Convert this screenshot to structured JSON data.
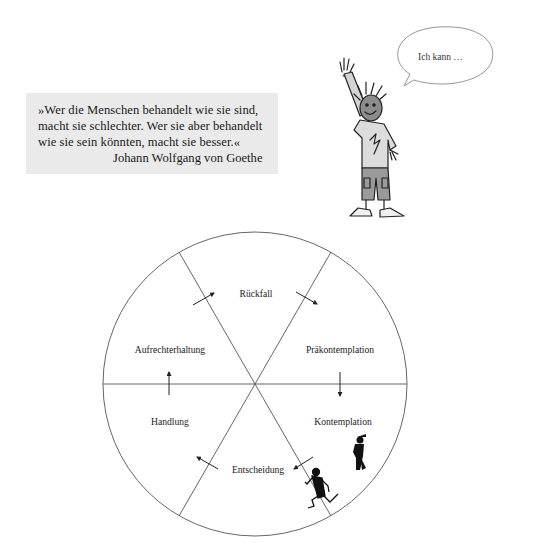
{
  "quote": {
    "lines": [
      "»Wer die Menschen behandelt wie sie sind,",
      "macht sie schlechter. Wer sie aber behandelt",
      "wie sie sein könnten, macht sie besser.«"
    ],
    "author": "Johann Wolfgang von Goethe",
    "background": "#eaeaea"
  },
  "speech_bubble": {
    "text": "Ich kann …"
  },
  "illustration": {
    "figure": "waving-boy-cartoon"
  },
  "cycle": {
    "title": "",
    "center": [
      255,
      384
    ],
    "radius": 152,
    "stages": [
      {
        "label": "Rückfall",
        "x": 256,
        "y": 293
      },
      {
        "label": "Präkontemplation",
        "x": 340,
        "y": 349
      },
      {
        "label": "Kontemplation",
        "x": 343,
        "y": 421
      },
      {
        "label": "Entscheidung",
        "x": 255,
        "y": 469
      },
      {
        "label": "Handlung",
        "x": 170,
        "y": 421
      },
      {
        "label": "Aufrechterhaltung",
        "x": 170,
        "y": 349
      }
    ],
    "decorations": [
      "standing-figure-icon",
      "running-figure-icon"
    ]
  }
}
